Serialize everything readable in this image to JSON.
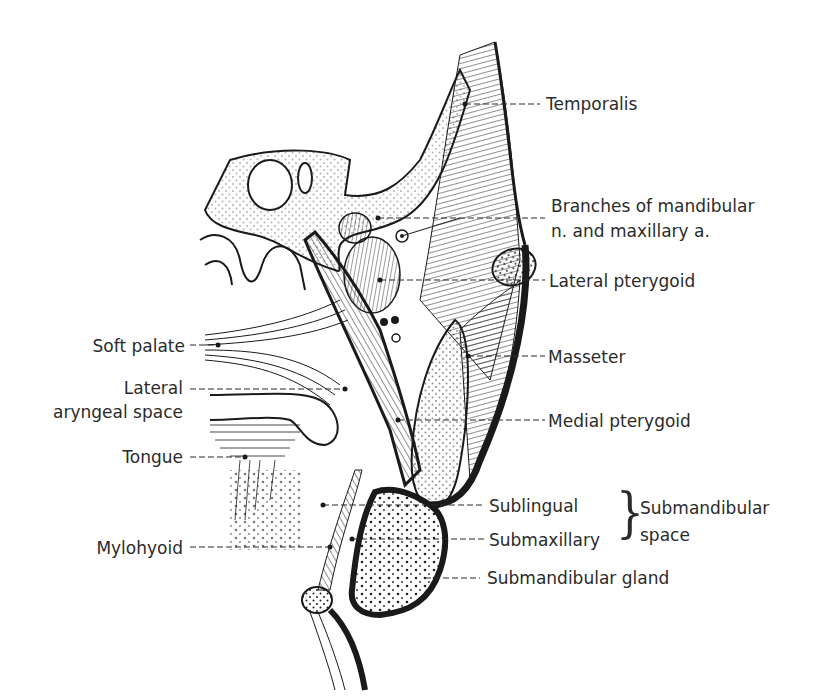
{
  "figure": {
    "colors": {
      "ink": "#1a1a1a",
      "label": "#2b2b2b",
      "background": "#ffffff"
    }
  },
  "labels_right": [
    {
      "id": "temporalis",
      "text": "Temporalis"
    },
    {
      "id": "branches",
      "text": "Branches of mandibular"
    },
    {
      "id": "branches2",
      "text": "n. and maxillary a."
    },
    {
      "id": "lateral-pterygoid",
      "text": "Lateral pterygoid"
    },
    {
      "id": "masseter",
      "text": "Masseter"
    },
    {
      "id": "medial-pterygoid",
      "text": "Medial pterygoid"
    },
    {
      "id": "sublingual",
      "text": "Sublingual"
    },
    {
      "id": "submaxillary",
      "text": "Submaxillary"
    },
    {
      "id": "submandibular-gland",
      "text": "Submandibular gland"
    }
  ],
  "labels_left": [
    {
      "id": "soft-palate",
      "text": "Soft palate"
    },
    {
      "id": "lateral-1",
      "text": "Lateral"
    },
    {
      "id": "lateral-2",
      "text": "aryngeal space"
    },
    {
      "id": "tongue",
      "text": "Tongue"
    },
    {
      "id": "mylohyoid",
      "text": "Mylohyoid"
    }
  ],
  "group_label": {
    "line1": "Submandibular",
    "line2": "space",
    "brace": "}"
  }
}
